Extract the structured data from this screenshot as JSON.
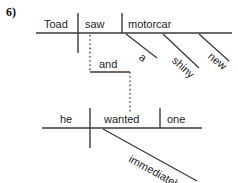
{
  "exercise": {
    "number_label": "6)"
  },
  "diagram": {
    "type": "sentence-diagram",
    "sentence": "Toad saw a shiny new motorcar and he wanted one immediately",
    "line_color": "#3a3a3a",
    "text_color": "#1d1d1d",
    "background_color": "#ffffff",
    "clauses": [
      {
        "name": "upper-clause",
        "baseline_y": 33,
        "baseline_x1": 36,
        "baseline_x2": 232,
        "subject": "Toad",
        "verb": "saw",
        "direct_object": "motorcar",
        "modifiers": [
          {
            "word": "a",
            "modifies": "motorcar"
          },
          {
            "word": "shiny",
            "modifies": "motorcar"
          },
          {
            "word": "new",
            "modifies": "motorcar"
          }
        ]
      },
      {
        "name": "lower-clause",
        "baseline_y": 128,
        "baseline_x1": 42,
        "baseline_x2": 202,
        "subject": "he",
        "verb": "wanted",
        "direct_object": "one",
        "modifiers": [
          {
            "word": "immediately",
            "modifies": "wanted"
          }
        ]
      }
    ],
    "conjunction": {
      "word": "and",
      "line_y": 72,
      "line_x1": 90,
      "line_x2": 130,
      "dotted": true
    },
    "labels": {
      "subject_upper": "Toad",
      "verb_upper": "saw",
      "object_upper": "motorcar",
      "modifier_a": "a",
      "modifier_shiny": "shiny",
      "modifier_new": "new",
      "conjunction": "and",
      "subject_lower": "he",
      "verb_lower": "wanted",
      "object_lower": "one",
      "modifier_immediately": "immediately"
    }
  }
}
